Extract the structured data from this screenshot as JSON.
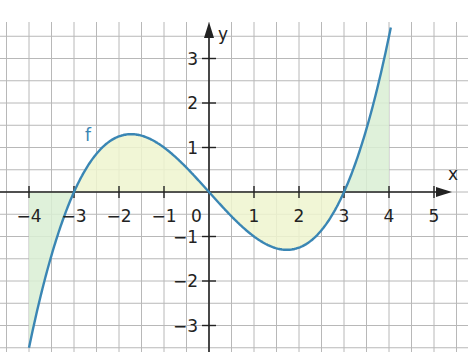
{
  "chart_data": {
    "type": "line",
    "title": "",
    "function_label": "f",
    "xlabel": "x",
    "ylabel": "y",
    "x_ticks": [
      -4,
      -3,
      -2,
      -1,
      0,
      1,
      2,
      3,
      4,
      5
    ],
    "x_tick_labels": [
      "−4",
      "−3",
      "−2",
      "−1",
      "0",
      "1",
      "2",
      "3",
      "4",
      "5"
    ],
    "y_ticks": [
      -3,
      -2,
      -1,
      1,
      2,
      3
    ],
    "y_tick_labels": [
      "−3",
      "−2",
      "−1",
      "1",
      "2",
      "3"
    ],
    "origin_label": "0",
    "xlim": [
      -4.6,
      5.7
    ],
    "ylim": [
      -3.5,
      4.2
    ],
    "grid": true,
    "grid_step": 0.5,
    "series": [
      {
        "name": "f",
        "formula": "f(x) = (x^3 - 9x)/8",
        "x": [
          -4,
          -3.5,
          -3,
          -2.5,
          -2,
          -1.73,
          -1.5,
          -1,
          -0.5,
          0,
          0.5,
          1,
          1.5,
          1.73,
          2,
          2.5,
          3,
          3.5,
          4
        ],
        "y": [
          -3.5,
          -1.42,
          0,
          0.86,
          1.25,
          1.3,
          1.27,
          1.0,
          0.55,
          0,
          -0.55,
          -1.0,
          -1.27,
          -1.3,
          -1.25,
          -0.86,
          0,
          1.42,
          3.5
        ],
        "color": "#3a86b4"
      }
    ],
    "shaded_regions": [
      {
        "from": -4,
        "to": -3,
        "color": "#d9efd4"
      },
      {
        "from": -3,
        "to": 0,
        "color": "#eef5cf"
      },
      {
        "from": 0,
        "to": 3,
        "color": "#eef5cf"
      },
      {
        "from": 3,
        "to": 4,
        "color": "#d9efd4"
      }
    ],
    "zeros": [
      -3,
      0,
      3
    ]
  }
}
